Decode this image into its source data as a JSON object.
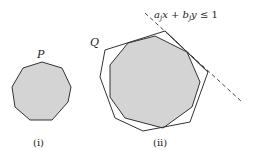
{
  "figure": {
    "panels": [
      {
        "id": "i",
        "caption": "(i)",
        "polygon_label": "P",
        "shape": "nonagon",
        "points": [
          [
            42,
            62
          ],
          [
            62,
            68
          ],
          [
            71,
            87
          ],
          [
            68,
            102
          ],
          [
            52,
            120
          ],
          [
            30,
            120
          ],
          [
            15,
            107
          ],
          [
            12,
            87
          ],
          [
            23,
            68
          ]
        ],
        "fill": "#d4d4d4",
        "stroke": "#333333"
      },
      {
        "id": "ii",
        "caption": "(ii)",
        "outer_label": "Q",
        "outer_points": [
          [
            105,
            50
          ],
          [
            165,
            31
          ],
          [
            208,
            72
          ],
          [
            190,
            122
          ],
          [
            143,
            131
          ],
          [
            115,
            118
          ],
          [
            100,
            77
          ]
        ],
        "inner_points": [
          [
            128,
            43
          ],
          [
            155,
            36
          ],
          [
            187,
            52
          ],
          [
            200,
            82
          ],
          [
            192,
            107
          ],
          [
            163,
            128
          ],
          [
            125,
            118
          ],
          [
            110,
            97
          ],
          [
            110,
            65
          ]
        ],
        "inner_fill": "#d4d4d4",
        "stroke": "#333333",
        "constraint": {
          "label": "a_j x + b_j y ≤ 1",
          "label_parts": {
            "a": "a",
            "j1": "j",
            "x": "x",
            "plus": " + ",
            "b": "b",
            "j2": "j",
            "y": "y",
            "leq": " ≤ 1"
          },
          "line_start": [
            145,
            13
          ],
          "line_end": [
            242,
            102
          ],
          "style": "dashed"
        }
      }
    ]
  }
}
